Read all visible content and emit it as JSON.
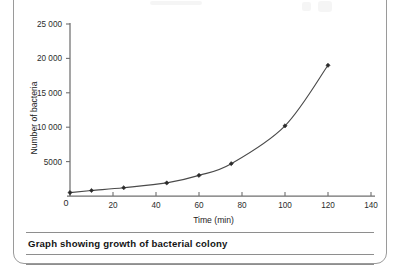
{
  "frame": {
    "caption": "Graph showing growth of bacterial colony"
  },
  "chart_data": {
    "type": "line",
    "title": "",
    "subtitle": "",
    "xlabel": "Time (min)",
    "ylabel": "Number of bacteria",
    "xlim": [
      0,
      140
    ],
    "ylim": [
      0,
      25000
    ],
    "xticks": [
      0,
      20,
      40,
      60,
      80,
      100,
      120,
      140
    ],
    "xtick_labels": [
      "0",
      "20",
      "40",
      "60",
      "80",
      "100",
      "120",
      "140"
    ],
    "yticks": [
      5000,
      10000,
      15000,
      20000,
      25000
    ],
    "ytick_labels": [
      "5000",
      "10 000",
      "15 000",
      "20 000",
      "25 000"
    ],
    "origin_label": "0",
    "grid": false,
    "legend": false,
    "marker": "diamond",
    "series": [
      {
        "name": "Number of bacteria",
        "x": [
          0,
          10,
          25,
          45,
          60,
          75,
          100,
          120
        ],
        "values": [
          500,
          800,
          1200,
          1900,
          3000,
          4700,
          10200,
          19000
        ]
      }
    ]
  },
  "colors": {
    "axis": "#6f6f6f",
    "curve": "#4a4a4a",
    "marker": "#2b2b2b",
    "text": "#1d1d1d",
    "frame": "#9a9a9a",
    "rule": "#8e8e8e"
  }
}
